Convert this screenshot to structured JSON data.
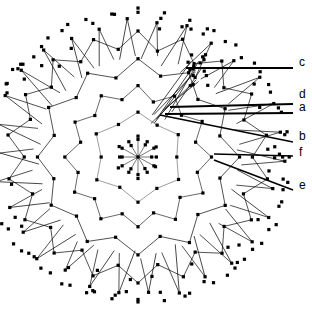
{
  "figure": {
    "type": "radial-starburst-diagram",
    "background_color": "#ffffff",
    "stroke_color": "#000000",
    "dot_color": "#000000",
    "center": {
      "x": 138,
      "y": 157
    },
    "dot_size_px": 3.2,
    "ring_count": 6,
    "spokes": 36,
    "ring_radii": [
      18,
      42,
      66,
      92,
      120,
      148
    ],
    "ring_zigzag_amplitude": [
      6,
      9,
      12,
      14,
      16,
      0
    ],
    "width": 312,
    "height": 312
  },
  "callouts": [
    {
      "id": "c",
      "label": "c",
      "label_x": 299,
      "label_y": 62,
      "line_from": {
        "x": 186,
        "y": 68
      },
      "line_to": {
        "x": 293,
        "y": 68
      },
      "stroke_width": 1.8
    },
    {
      "id": "d",
      "label": "d",
      "label_x": 299,
      "label_y": 94,
      "line_from": {
        "x": 170,
        "y": 107
      },
      "line_to": {
        "x": 293,
        "y": 104
      },
      "stroke_width": 1.8
    },
    {
      "id": "a",
      "label": "a",
      "label_x": 299,
      "label_y": 107,
      "line_from": {
        "x": 165,
        "y": 114
      },
      "line_to": {
        "x": 293,
        "y": 113
      },
      "stroke_width": 1.8
    },
    {
      "id": "b",
      "label": "b",
      "label_x": 299,
      "label_y": 136,
      "line_from": {
        "x": 160,
        "y": 115
      },
      "line_to": {
        "x": 293,
        "y": 142
      },
      "stroke_width": 1.4
    },
    {
      "id": "f",
      "label": "f",
      "label_x": 299,
      "label_y": 152,
      "line_from": {
        "x": 214,
        "y": 154
      },
      "line_to": {
        "x": 293,
        "y": 156
      },
      "stroke_width": 1.4
    },
    {
      "id": "e",
      "label": "e",
      "label_x": 299,
      "label_y": 185,
      "line_from": {
        "x": 214,
        "y": 160
      },
      "line_to": {
        "x": 293,
        "y": 190
      },
      "stroke_width": 1.6
    }
  ],
  "chart_data": {
    "type": "scatter",
    "title": "",
    "xlabel": "",
    "ylabel": "",
    "legend": [
      "a",
      "b",
      "c",
      "d",
      "e",
      "f"
    ],
    "annotations": [
      "a",
      "b",
      "c",
      "d",
      "e",
      "f"
    ],
    "grid": false
  }
}
